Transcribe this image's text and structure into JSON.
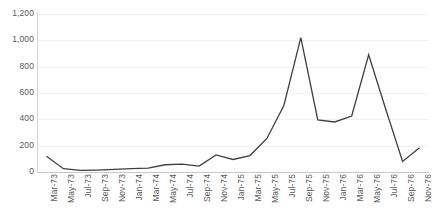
{
  "chart_data": {
    "type": "line",
    "title": "",
    "subtitle": "",
    "xlabel": "",
    "ylabel": "",
    "grid": true,
    "legend": false,
    "legend_position": "none",
    "line_color": "#3f3f3f",
    "gridline_color": "#f2f2f2",
    "axis_color": "#d0d0d0",
    "tick_label_color": "#58585a",
    "ylim": [
      0,
      1200
    ],
    "yticks": [
      0,
      200,
      400,
      600,
      800,
      1000,
      1200
    ],
    "ytick_labels": [
      "0",
      "200",
      "400",
      "600",
      "800",
      "1,000",
      "1,200"
    ],
    "categories": [
      "Mar-73",
      "May-73",
      "Jul-73",
      "Sep-73",
      "Nov-73",
      "Jan-74",
      "Mar-74",
      "May-74",
      "Jul-74",
      "Sep-74",
      "Nov-74",
      "Jan-75",
      "Mar-75",
      "May-75",
      "Jul-75",
      "Sep-75",
      "Nov-75",
      "Jan-76",
      "Mar-76",
      "May-76",
      "Jul-76",
      "Sep-76",
      "Nov-76"
    ],
    "values": [
      120,
      25,
      12,
      15,
      20,
      25,
      30,
      55,
      60,
      45,
      130,
      95,
      125,
      255,
      505,
      1020,
      395,
      380,
      425,
      890,
      480,
      80,
      185
    ],
    "series": [
      {
        "name": "",
        "values": [
          120,
          25,
          12,
          15,
          20,
          25,
          30,
          55,
          60,
          45,
          130,
          95,
          125,
          255,
          505,
          1020,
          395,
          380,
          425,
          890,
          480,
          80,
          185
        ]
      }
    ]
  }
}
